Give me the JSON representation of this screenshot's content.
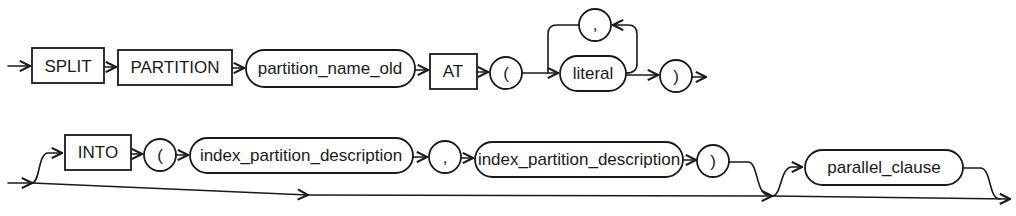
{
  "diagram": {
    "type": "syntax-railroad",
    "row1": {
      "keyword_split": "SPLIT",
      "keyword_partition": "PARTITION",
      "partition_name_old": "partition_name_old",
      "keyword_at": "AT",
      "open_paren": "(",
      "loop_separator": ",",
      "literal": "literal",
      "close_paren": ")"
    },
    "row2": {
      "keyword_into": "INTO",
      "open_paren": "(",
      "index_partition_description_1": "index_partition_description",
      "separator": ",",
      "index_partition_description_2": "index_partition_description",
      "close_paren": ")",
      "parallel_clause": "parallel_clause"
    },
    "colors": {
      "stroke": "#1a1a1a",
      "background": "#ffffff"
    }
  }
}
